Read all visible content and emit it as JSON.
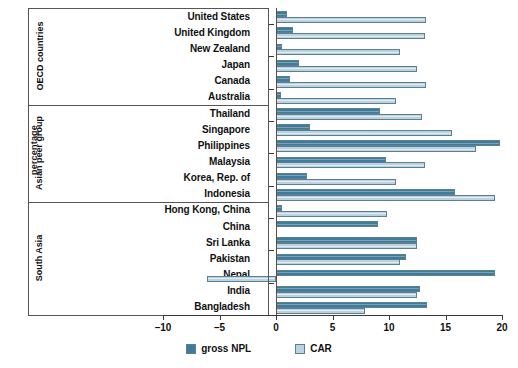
{
  "chart_data": {
    "type": "bar",
    "orientation": "horizontal",
    "title": "",
    "xlabel": "",
    "ylabel": "percentage",
    "xlim": [
      -10,
      20
    ],
    "xticks": [
      -10,
      -5,
      0,
      5,
      10,
      15,
      20
    ],
    "xticklabels": [
      "–10",
      "–5",
      "0",
      "5",
      "10",
      "15",
      "20"
    ],
    "grid": false,
    "legend_position": "bottom-center",
    "legend": [
      "gross NPL",
      "CAR"
    ],
    "series": [
      {
        "name": "gross NPL",
        "color": "#3f7c9b",
        "values": [
          1.0,
          1.5,
          0.5,
          2.0,
          1.2,
          0.4,
          9.2,
          3.0,
          19.8,
          9.7,
          2.7,
          15.8,
          0.5,
          9.0,
          12.5,
          11.5,
          19.4,
          12.7,
          13.4
        ]
      },
      {
        "name": "CAR",
        "color": "#bcd3df",
        "values": [
          13.3,
          13.2,
          11.0,
          12.5,
          13.3,
          10.6,
          12.9,
          15.6,
          17.7,
          13.2,
          10.6,
          19.4,
          9.8,
          0.0,
          12.5,
          11.0,
          -6.1,
          12.5,
          7.9
        ]
      }
    ],
    "categories": [
      "United States",
      "United Kingdom",
      "New Zealand",
      "Japan",
      "Canada",
      "Australia",
      "Thailand",
      "Singapore",
      "Philippines",
      "Malaysia",
      "Korea, Rep. of",
      "Indonesia",
      "Hong Kong, China",
      "China",
      "Sri Lanka",
      "Pakistan",
      "Nepal",
      "India",
      "Bangladesh"
    ],
    "groups": [
      {
        "label": "OECD countries",
        "start": 0,
        "count": 6
      },
      {
        "label": "Asian peer group",
        "start": 6,
        "count": 6
      },
      {
        "label": "South Asia",
        "start": 12,
        "count": 7
      }
    ]
  }
}
